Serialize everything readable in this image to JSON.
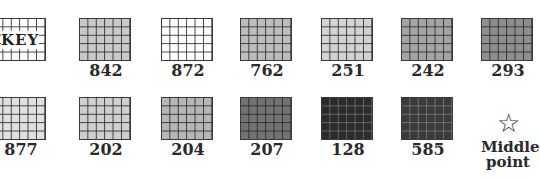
{
  "legend": {
    "key_label": "KEY",
    "swatches": [
      {
        "label": "842",
        "color": "#c9c9c9"
      },
      {
        "label": "872",
        "color": "#ffffff"
      },
      {
        "label": "762",
        "color": "#bdbdbd"
      },
      {
        "label": "251",
        "color": "#d3d3d3"
      },
      {
        "label": "242",
        "color": "#a4a4a4"
      },
      {
        "label": "293",
        "color": "#8f8f8f"
      },
      {
        "label": "877",
        "color": "#e0e0e0"
      },
      {
        "label": "202",
        "color": "#cfcfcf"
      },
      {
        "label": "204",
        "color": "#b7b7b7"
      },
      {
        "label": "207",
        "color": "#727272"
      },
      {
        "label": "128",
        "color": "#2b2b2b"
      },
      {
        "label": "585",
        "color": "#3a3a3a"
      }
    ],
    "middle_point": {
      "icon": "star-outline-icon",
      "glyph": "☆",
      "label_line1": "Middle",
      "label_line2": "point"
    }
  }
}
